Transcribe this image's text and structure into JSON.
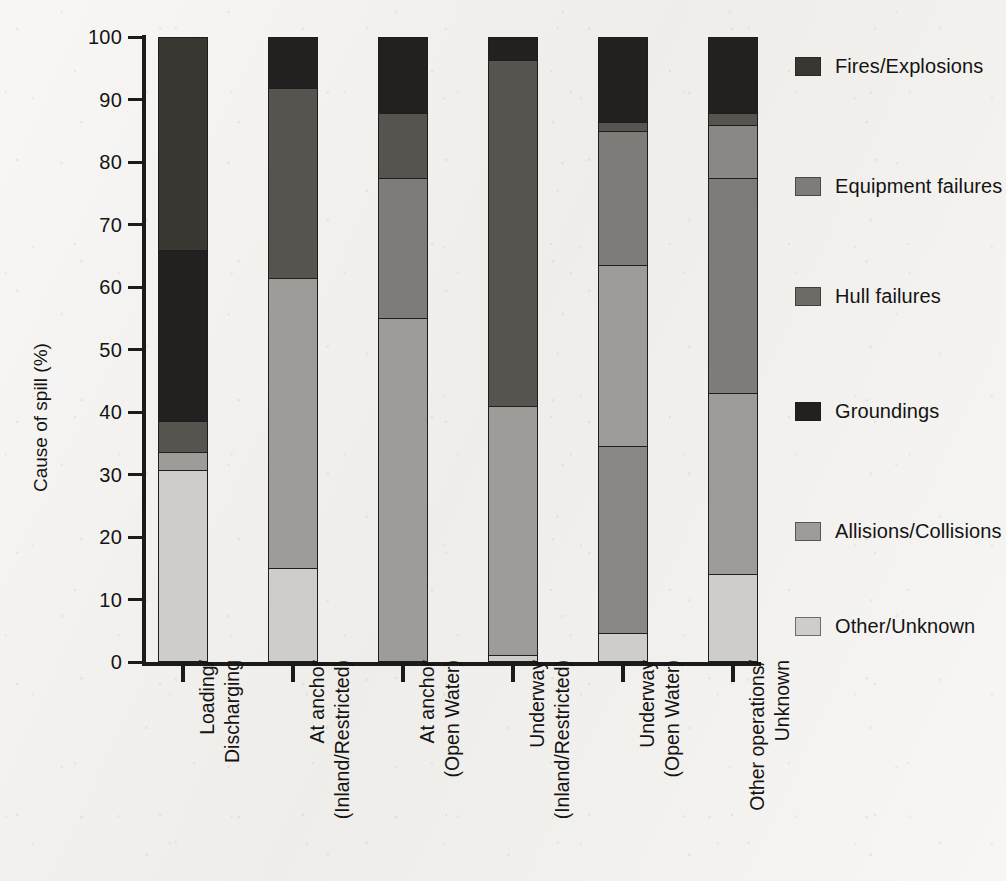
{
  "chart_data": {
    "type": "bar",
    "subtype": "stacked-vertical-100pct",
    "title": "",
    "xlabel": "",
    "ylabel": "Cause of spill (%)",
    "ylim": [
      0,
      100
    ],
    "yticks": [
      0,
      10,
      20,
      30,
      40,
      50,
      60,
      70,
      80,
      90,
      100
    ],
    "ytick_labels": [
      "0",
      "10",
      "20",
      "30",
      "40",
      "50",
      "60",
      "70",
      "80",
      "90",
      "100"
    ],
    "grid": false,
    "legend_position": "right",
    "categories": [
      "Loading/ Discharging",
      "At anchor (Inland/Restricted)",
      "At anchor (Open Water)",
      "Underway (Inland/Restricted)",
      "Underway (Open Water)",
      "Other operations/ Unknown"
    ],
    "category_labels": [
      {
        "line1": "Loading/",
        "line2": "Discharging"
      },
      {
        "line1": "At anchor",
        "line2": "(Inland/Restricted)"
      },
      {
        "line1": "At anchor",
        "line2": "(Open Water)"
      },
      {
        "line1": "Underway",
        "line2": "(Inland/Restricted)"
      },
      {
        "line1": "Underway",
        "line2": "(Open Water)"
      },
      {
        "line1": "Other operations/",
        "line2": "Unknown"
      }
    ],
    "series": [
      {
        "name": "Fires/Explosions",
        "color": "#3a3733",
        "values": [
          34.0,
          0.0,
          0.0,
          0.0,
          0.0,
          0.0
        ]
      },
      {
        "name": "Equipment failures",
        "color": "#7e7c79",
        "values": [
          0.0,
          0.0,
          22.5,
          0.0,
          21.5,
          34.5
        ]
      },
      {
        "name": "Hull failures",
        "color": "#575450",
        "values": [
          5.0,
          30.5,
          10.5,
          55.5,
          1.5,
          8.5
        ]
      },
      {
        "name": "Groundings",
        "color": "#232020",
        "values": [
          27.5,
          8.0,
          12.0,
          3.5,
          13.5,
          12.0
        ]
      },
      {
        "name": "Allisions/Collisions",
        "color": "#9e9c99",
        "values": [
          2.8,
          46.5,
          55.0,
          40.0,
          29.0,
          29.0
        ]
      },
      {
        "name": "Other/Unknown",
        "color": "#cfcdc9",
        "values": [
          30.7,
          15.0,
          0.0,
          1.0,
          4.5,
          14.0
        ]
      }
    ],
    "stack_order_top_to_bottom": [
      "Fires/Explosions",
      "Groundings",
      "Hull failures",
      "Equipment failures",
      "Allisions/Collisions",
      "Other/Unknown"
    ],
    "bars": [
      {
        "category": "Loading/ Discharging",
        "segments": [
          {
            "series": "Fires/Explosions",
            "value": 34.0,
            "from": 66.0,
            "to": 100.0
          },
          {
            "series": "Groundings",
            "value": 27.5,
            "from": 38.5,
            "to": 66.0
          },
          {
            "series": "Hull failures",
            "value": 5.0,
            "from": 33.5,
            "to": 38.5
          },
          {
            "series": "Allisions/Collisions",
            "value": 2.8,
            "from": 30.7,
            "to": 33.5
          },
          {
            "series": "Other/Unknown",
            "value": 30.7,
            "from": 0.0,
            "to": 30.7
          }
        ]
      },
      {
        "category": "At anchor (Inland/Restricted)",
        "segments": [
          {
            "series": "Groundings",
            "value": 8.0,
            "from": 92.0,
            "to": 100.0
          },
          {
            "series": "Hull failures",
            "value": 30.5,
            "from": 61.5,
            "to": 92.0
          },
          {
            "series": "Allisions/Collisions",
            "value": 46.5,
            "from": 15.0,
            "to": 61.5
          },
          {
            "series": "Other/Unknown",
            "value": 15.0,
            "from": 0.0,
            "to": 15.0
          }
        ]
      },
      {
        "category": "At anchor (Open Water)",
        "segments": [
          {
            "series": "Groundings",
            "value": 12.0,
            "from": 88.0,
            "to": 100.0
          },
          {
            "series": "Hull failures",
            "value": 10.5,
            "from": 77.5,
            "to": 88.0
          },
          {
            "series": "Equipment failures",
            "value": 22.5,
            "from": 55.0,
            "to": 77.5
          },
          {
            "series": "Allisions/Collisions",
            "value": 55.0,
            "from": 0.0,
            "to": 55.0
          }
        ]
      },
      {
        "category": "Underway (Inland/Restricted)",
        "segments": [
          {
            "series": "Groundings",
            "value": 3.5,
            "from": 96.5,
            "to": 100.0
          },
          {
            "series": "Hull failures",
            "value": 55.5,
            "from": 41.0,
            "to": 96.5
          },
          {
            "series": "Allisions/Collisions",
            "value": 40.0,
            "from": 1.0,
            "to": 41.0
          },
          {
            "series": "Other/Unknown",
            "value": 1.0,
            "from": 0.0,
            "to": 1.0
          }
        ]
      },
      {
        "category": "Underway (Open Water)",
        "segments": [
          {
            "series": "Groundings",
            "value": 13.5,
            "from": 86.5,
            "to": 100.0
          },
          {
            "series": "Hull failures",
            "value": 1.5,
            "from": 85.0,
            "to": 86.5
          },
          {
            "series": "Equipment failures",
            "value": 21.5,
            "from": 63.5,
            "to": 85.0
          },
          {
            "series": "Allisions/Collisions",
            "value": 29.0,
            "from": 34.5,
            "to": 63.5
          },
          {
            "series": "Hull failures 2",
            "value": 30.0,
            "from": 4.5,
            "to": 34.5
          },
          {
            "series": "Other/Unknown",
            "value": 4.5,
            "from": 0.0,
            "to": 4.5
          }
        ]
      },
      {
        "category": "Other operations/ Unknown",
        "segments": [
          {
            "series": "Groundings",
            "value": 12.0,
            "from": 88.0,
            "to": 100.0
          },
          {
            "series": "Hull failures",
            "value": 2.0,
            "from": 86.0,
            "to": 88.0
          },
          {
            "series": "Hull failures 2",
            "value": 8.5,
            "from": 77.5,
            "to": 86.0
          },
          {
            "series": "Equipment failures",
            "value": 34.5,
            "from": 43.0,
            "to": 77.5
          },
          {
            "series": "Allisions/Collisions",
            "value": 29.0,
            "from": 14.0,
            "to": 43.0
          },
          {
            "series": "Other/Unknown",
            "value": 14.0,
            "from": 0.0,
            "to": 14.0
          }
        ]
      }
    ],
    "legend": [
      {
        "label": "Fires/Explosions",
        "color": "#3a3733"
      },
      {
        "label": "Equipment failures",
        "color": "#7e7c79"
      },
      {
        "label": "Hull failures",
        "color": "#6e6b67"
      },
      {
        "label": "Groundings",
        "color": "#232020"
      },
      {
        "label": "Allisions/Collisions",
        "color": "#9e9c99"
      },
      {
        "label": "Other/Unknown",
        "color": "#cfcdc9"
      }
    ]
  },
  "colors": {
    "background": "#f1efec",
    "axis": "#1b1b1b",
    "text": "#141414"
  }
}
